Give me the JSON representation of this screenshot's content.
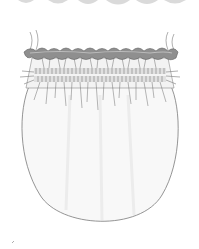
{
  "illustration": {
    "subject": "smocked-drawstring-pouch",
    "colors": {
      "background": "#ffffff",
      "outline": "#6b6b6b",
      "ruffle_fill": "#8c8c8c",
      "ruffle_highlight": "#b5b5b5",
      "smocking_band": "#d9d9d9",
      "body_fill": "#f7f7f7",
      "top_wave": "#d4d4d4"
    }
  }
}
